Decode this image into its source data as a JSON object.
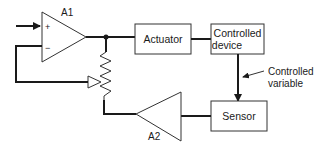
{
  "diagram": {
    "type": "closed-loop control system block diagram",
    "amplifiers": [
      {
        "id": "A1",
        "label": "A1",
        "inputs": [
          "+",
          "−"
        ]
      },
      {
        "id": "A2",
        "label": "A2"
      }
    ],
    "blocks": {
      "actuator": {
        "label": "Actuator"
      },
      "controlled_device": {
        "line1": "Controlled",
        "line2": "device"
      },
      "sensor": {
        "label": "Sensor"
      }
    },
    "annotations": {
      "controlled_variable": {
        "line1": "Controlled",
        "line2": "variable"
      }
    },
    "components": {
      "potentiometer": "resistor with wiper (feedback divider)"
    },
    "connections": [
      {
        "from": "input",
        "to": "A1.+"
      },
      {
        "from": "A1.output",
        "to": "Actuator"
      },
      {
        "from": "A1.output",
        "to": "potentiometer.top"
      },
      {
        "from": "Actuator",
        "to": "Controlled device"
      },
      {
        "from": "Controlled device",
        "to": "Sensor",
        "label": "Controlled variable"
      },
      {
        "from": "Sensor",
        "to": "A2.input"
      },
      {
        "from": "A2.output",
        "to": "potentiometer.bottom"
      },
      {
        "from": "potentiometer.wiper",
        "to": "A1.−"
      }
    ],
    "colors": {
      "line": "#1a1a1a",
      "box_stroke": "#333333",
      "background": "#ffffff"
    }
  }
}
